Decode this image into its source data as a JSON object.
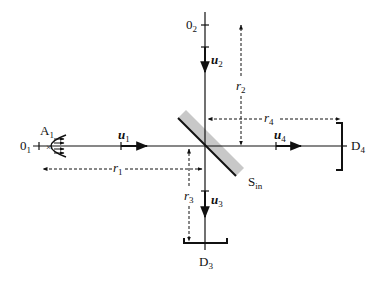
{
  "diagram": {
    "type": "beam-splitter interferometer schematic",
    "colors": {
      "line": "#111111",
      "splitter": "#c8c8c8",
      "background": "#ffffff"
    },
    "labels": {
      "source_label": "A",
      "source_sub": "1",
      "origin1": "0",
      "origin1_sub": "1",
      "origin2": "0",
      "origin2_sub": "2",
      "u1": "u",
      "u1_sub": "1",
      "u2": "u",
      "u2_sub": "2",
      "u3": "u",
      "u3_sub": "3",
      "u4": "u",
      "u4_sub": "4",
      "r1": "r",
      "r1_sub": "1",
      "r2": "r",
      "r2_sub": "2",
      "r3": "r",
      "r3_sub": "3",
      "r4": "r",
      "r4_sub": "4",
      "splitter": "S",
      "splitter_sub": "in",
      "detector3": "D",
      "detector3_sub": "3",
      "detector4": "D",
      "detector4_sub": "4"
    }
  }
}
